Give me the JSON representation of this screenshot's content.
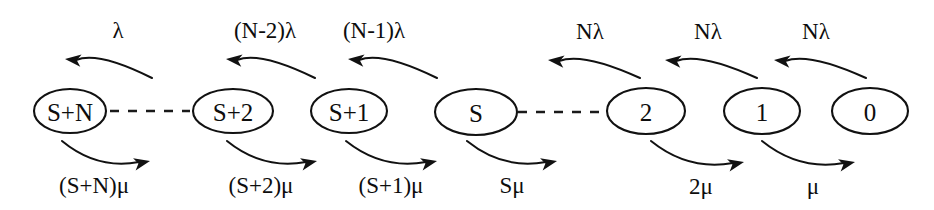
{
  "diagram": {
    "type": "state-transition-diagram",
    "colors": {
      "stroke": "#111111",
      "text": "#0d0d0d",
      "background": "#ffffff"
    },
    "states": [
      {
        "id": "s-plus-n",
        "label": "S+N",
        "cx": 70,
        "cy": 111,
        "rx": 36,
        "ry": 22
      },
      {
        "id": "s-plus-2",
        "label": "S+2",
        "cx": 233,
        "cy": 111,
        "rx": 40,
        "ry": 22
      },
      {
        "id": "s-plus-1",
        "label": "S+1",
        "cx": 349,
        "cy": 111,
        "rx": 38,
        "ry": 22
      },
      {
        "id": "s",
        "label": "S",
        "cx": 476,
        "cy": 112,
        "rx": 41,
        "ry": 23
      },
      {
        "id": "two",
        "label": "2",
        "cx": 646,
        "cy": 111,
        "rx": 39,
        "ry": 23
      },
      {
        "id": "one",
        "label": "1",
        "cx": 762,
        "cy": 111,
        "rx": 38,
        "ry": 23
      },
      {
        "id": "zero",
        "label": "0",
        "cx": 870,
        "cy": 111,
        "rx": 38,
        "ry": 23
      }
    ],
    "upper_transitions": [
      {
        "id": "lambda-1",
        "label": "λ",
        "label_x": 118,
        "label_y": 30,
        "from": 152,
        "to": 65,
        "peak": 58
      },
      {
        "id": "lambda-n-2",
        "label": "(N-2)λ",
        "label_x": 265,
        "label_y": 30,
        "from": 315,
        "to": 226,
        "peak": 58
      },
      {
        "id": "lambda-n-1",
        "label": "(N-1)λ",
        "label_x": 374,
        "label_y": 30,
        "from": 437,
        "to": 348,
        "peak": 58
      },
      {
        "id": "lambda-n-a",
        "label": "Nλ",
        "label_x": 590,
        "label_y": 31,
        "from": 640,
        "to": 548,
        "peak": 59
      },
      {
        "id": "lambda-n-b",
        "label": "Nλ",
        "label_x": 708,
        "label_y": 31,
        "from": 757,
        "to": 665,
        "peak": 59
      },
      {
        "id": "lambda-n-c",
        "label": "Nλ",
        "label_x": 816,
        "label_y": 31,
        "from": 866,
        "to": 774,
        "peak": 59
      }
    ],
    "lower_transitions": [
      {
        "id": "mu-s-plus-n",
        "label": "(S+N)μ",
        "label_x": 94,
        "label_y": 185,
        "from": 62,
        "to": 150,
        "dip": 164
      },
      {
        "id": "mu-s-plus-2",
        "label": "(S+2)μ",
        "label_x": 261,
        "label_y": 185,
        "from": 227,
        "to": 317,
        "dip": 164
      },
      {
        "id": "mu-s-plus-1",
        "label": "(S+1)μ",
        "label_x": 391,
        "label_y": 185,
        "from": 346,
        "to": 437,
        "dip": 164
      },
      {
        "id": "mu-s",
        "label": "Sμ",
        "label_x": 512,
        "label_y": 185,
        "from": 467,
        "to": 557,
        "dip": 164
      },
      {
        "id": "mu-2",
        "label": "2μ",
        "label_x": 701,
        "label_y": 186,
        "from": 651,
        "to": 744,
        "dip": 165
      },
      {
        "id": "mu-1",
        "label": "μ",
        "label_x": 813,
        "label_y": 186,
        "from": 762,
        "to": 855,
        "dip": 165
      }
    ],
    "dashed_links": [
      {
        "id": "dashed-left",
        "x1": 110,
        "x2": 190,
        "y": 111
      },
      {
        "id": "dashed-right",
        "x1": 518,
        "x2": 602,
        "y": 112
      }
    ]
  }
}
